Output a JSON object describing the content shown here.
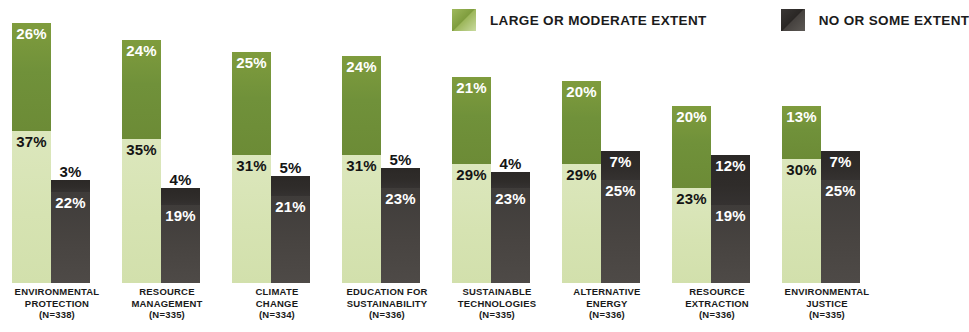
{
  "legend": {
    "items": [
      {
        "label": "LARGE OR MODERATE EXTENT",
        "swatch": "green-swatch",
        "color": "#7f9c3d"
      },
      {
        "label": "NO OR SOME EXTENT",
        "swatch": "dark-swatch",
        "color": "#3f3c3a"
      }
    ]
  },
  "chart_data": {
    "type": "bar",
    "title": "",
    "subtitle": "",
    "xlabel": "",
    "ylabel": "",
    "ylim": [
      0,
      70
    ],
    "grid": false,
    "legend_position": "top-right",
    "stacked": true,
    "grouped": true,
    "categories": [
      "ENVIRONMENTAL PROTECTION",
      "RESOURCE MANAGEMENT",
      "CLIMATE CHANGE",
      "EDUCATION FOR SUSTAINABILITY",
      "SUSTAINABLE TECHNOLOGIES",
      "ALTERNATIVE ENERGY",
      "RESOURCE EXTRACTION",
      "ENVIRONMENTAL JUSTICE"
    ],
    "category_n": [
      "(N=338)",
      "(N=335)",
      "(N=334)",
      "(N=336)",
      "(N=335)",
      "(N=336)",
      "(N=336)",
      "(N=335)"
    ],
    "series": [
      {
        "name": "LARGE OR MODERATE EXTENT - upper",
        "values": [
          26,
          24,
          25,
          24,
          21,
          20,
          20,
          13
        ]
      },
      {
        "name": "LARGE OR MODERATE EXTENT - lower",
        "values": [
          37,
          35,
          31,
          31,
          29,
          29,
          23,
          30
        ]
      },
      {
        "name": "NO OR SOME EXTENT - upper",
        "values": [
          3,
          4,
          5,
          5,
          4,
          7,
          12,
          7
        ]
      },
      {
        "name": "NO OR SOME EXTENT - lower",
        "values": [
          22,
          19,
          21,
          23,
          23,
          25,
          19,
          25
        ]
      }
    ]
  },
  "groups": [
    {
      "name": "environmental-protection",
      "label_lines": [
        "ENVIRONMENTAL",
        "PROTECTION"
      ],
      "n": "(N=338)",
      "green_top": "26%",
      "green_bottom": "37%",
      "dark_top": "3%",
      "dark_bottom": "22%",
      "dark_top_placement": "above"
    },
    {
      "name": "resource-management",
      "label_lines": [
        "RESOURCE",
        "MANAGEMENT"
      ],
      "n": "(N=335)",
      "green_top": "24%",
      "green_bottom": "35%",
      "dark_top": "4%",
      "dark_bottom": "19%",
      "dark_top_placement": "above"
    },
    {
      "name": "climate-change",
      "label_lines": [
        "CLIMATE",
        "CHANGE"
      ],
      "n": "(N=334)",
      "green_top": "25%",
      "green_bottom": "31%",
      "dark_top": "5%",
      "dark_bottom": "21%",
      "dark_top_placement": "above"
    },
    {
      "name": "education-for-sustainability",
      "label_lines": [
        "EDUCATION FOR",
        "SUSTAINABILITY"
      ],
      "n": "(N=336)",
      "green_top": "24%",
      "green_bottom": "31%",
      "dark_top": "5%",
      "dark_bottom": "23%",
      "dark_top_placement": "above"
    },
    {
      "name": "sustainable-technologies",
      "label_lines": [
        "SUSTAINABLE",
        "TECHNOLOGIES"
      ],
      "n": "(N=335)",
      "green_top": "21%",
      "green_bottom": "29%",
      "dark_top": "4%",
      "dark_bottom": "23%",
      "dark_top_placement": "above"
    },
    {
      "name": "alternative-energy",
      "label_lines": [
        "ALTERNATIVE",
        "ENERGY"
      ],
      "n": "(N=336)",
      "green_top": "20%",
      "green_bottom": "29%",
      "dark_top": "7%",
      "dark_bottom": "25%",
      "dark_top_placement": "inside"
    },
    {
      "name": "resource-extraction",
      "label_lines": [
        "RESOURCE",
        "EXTRACTION"
      ],
      "n": "(N=336)",
      "green_top": "20%",
      "green_bottom": "23%",
      "dark_top": "12%",
      "dark_bottom": "19%",
      "dark_top_placement": "inside"
    },
    {
      "name": "environmental-justice",
      "label_lines": [
        "ENVIRONMENTAL",
        "JUSTICE"
      ],
      "n": "(N=335)",
      "green_top": "13%",
      "green_bottom": "30%",
      "dark_top": "7%",
      "dark_bottom": "25%",
      "dark_top_placement": "inside"
    }
  ]
}
